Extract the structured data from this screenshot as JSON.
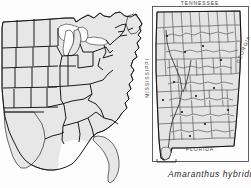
{
  "figure": {
    "caption": "Amaranthus hybridus",
    "background_color": "#fdfdfd",
    "state_fill_color": "#e7e7e7",
    "county_fill_color": "#e4e4e4",
    "outline_color": "#1a1a1a",
    "label_color": "#3c3c3c"
  },
  "us_map": {
    "name": "eastern-united-states-map",
    "description": "Outline map of the eastern and central United States with state boundaries"
  },
  "alabama_inset": {
    "name": "alabama-county-map",
    "description": "County map of Alabama shown as a framed inset",
    "labels": {
      "north": "TENNESSEE",
      "west": "MISSISSIPPI",
      "east": "GEORGIA",
      "south": "FLORIDA"
    }
  }
}
